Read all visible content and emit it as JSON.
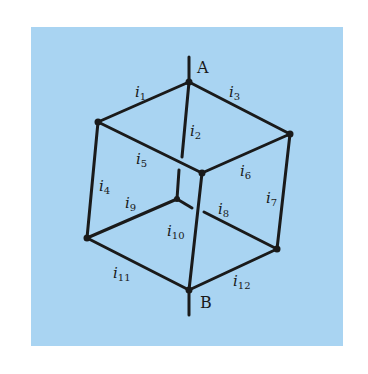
{
  "diagram": {
    "type": "resistor-cube-network",
    "background_color": "#a9d4f2",
    "line_color": "#1a1a1a",
    "nodes": [
      {
        "id": "A",
        "label": "A"
      },
      {
        "id": "B",
        "label": "B"
      }
    ],
    "edges": [
      {
        "id": "i1",
        "base": "i",
        "sub": "1"
      },
      {
        "id": "i2",
        "base": "i",
        "sub": "2"
      },
      {
        "id": "i3",
        "base": "i",
        "sub": "3"
      },
      {
        "id": "i4",
        "base": "i",
        "sub": "4"
      },
      {
        "id": "i5",
        "base": "i",
        "sub": "5"
      },
      {
        "id": "i6",
        "base": "i",
        "sub": "6"
      },
      {
        "id": "i7",
        "base": "i",
        "sub": "7"
      },
      {
        "id": "i8",
        "base": "i",
        "sub": "8"
      },
      {
        "id": "i9",
        "base": "i",
        "sub": "9"
      },
      {
        "id": "i10",
        "base": "i",
        "sub": "10"
      },
      {
        "id": "i11",
        "base": "i",
        "sub": "11"
      },
      {
        "id": "i12",
        "base": "i",
        "sub": "12"
      }
    ]
  }
}
